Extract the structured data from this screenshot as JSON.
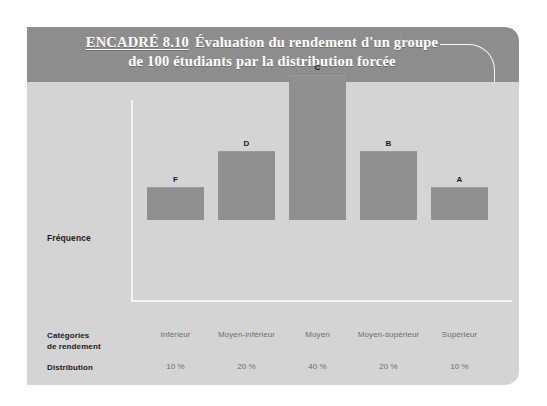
{
  "figure": {
    "tag": "ENCADRÉ 8.10",
    "title_line1": "Évaluation du rendement d'un groupe",
    "title_line2": "de 100 étudiants par la distribution forcée"
  },
  "axis": {
    "y_label": "Fréquence"
  },
  "rows": {
    "categories_label_line1": "Catégories",
    "categories_label_line2": "de rendement",
    "distribution_label": "Distribution",
    "count_label_line1": "Nombre d'étudiants",
    "count_label_line2": "à inclure dans",
    "count_label_line3": "chaque catégorie"
  },
  "colors": {
    "panel": "#d4d4d4",
    "header_band": "#8d8d8d",
    "bar": "#909090",
    "axis": "#f4f4f4",
    "label_dark": "#1b1b1b",
    "value_grey": "#6d6d6d"
  },
  "chart_data": {
    "type": "bar",
    "title": "Évaluation du rendement d'un groupe de 100 étudiants par la distribution forcée",
    "xlabel": "",
    "ylabel": "Fréquence",
    "grid": false,
    "legend": "none",
    "categories": [
      "Inférieur",
      "Moyen-inférieur",
      "Moyen",
      "Moyen-supérieur",
      "Supérieur"
    ],
    "grades": [
      "F",
      "D",
      "C",
      "B",
      "A"
    ],
    "values": [
      10,
      20,
      40,
      20,
      10
    ],
    "distribution": [
      "10 %",
      "20 %",
      "40 %",
      "20 %",
      "10 %"
    ],
    "student_counts": [
      "10",
      "20",
      "40",
      "20",
      "10"
    ],
    "ylim": [
      0,
      40
    ],
    "bar_px_heights": [
      33,
      69,
      145,
      69,
      33
    ]
  }
}
